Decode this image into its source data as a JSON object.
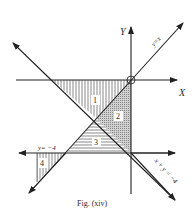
{
  "figure": {
    "caption": "Fig. (xiv)",
    "axes": {
      "x_label": "X",
      "y_label": "Y"
    },
    "lines": [
      {
        "name": "y=x",
        "label": "y=x"
      },
      {
        "name": "x+y=-4",
        "label": "x + y = −4"
      },
      {
        "name": "y=-4",
        "label": "y= −4"
      }
    ],
    "regions": [
      {
        "id": "1",
        "label": "1",
        "hatch": "vertical"
      },
      {
        "id": "2",
        "label": "2",
        "hatch": "cross"
      },
      {
        "id": "3",
        "label": "3",
        "hatch": "horizontal"
      },
      {
        "id": "4",
        "label": "4",
        "hatch": "vertical"
      }
    ],
    "colors": {
      "ink": "#2a2a2a",
      "background": "#ffffff"
    }
  }
}
